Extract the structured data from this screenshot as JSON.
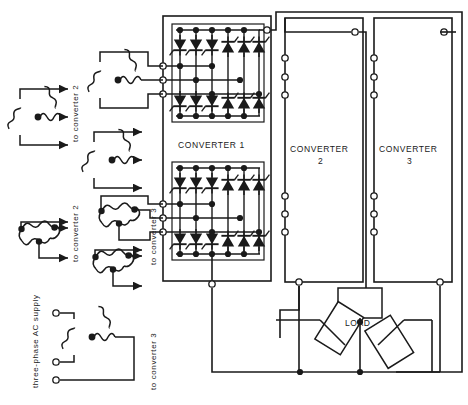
{
  "diagram": {
    "background_color": "#ffffff",
    "line_color": "#1a1a1a",
    "labels": {
      "converter_1": "CONVERTER 1",
      "converter_2_line1": "CONVERTER",
      "converter_2_line2": "2",
      "converter_3_line1": "CONVERTER",
      "converter_3_line2": "3",
      "load": "LOAD",
      "supply": "three-phase AC supply",
      "to_converter_2_upper": "to converter 2",
      "to_converter_3_upper": "to converter 3",
      "to_converter_2_lower": "to converter 2",
      "to_converter_3_lower": "to converter 3"
    },
    "blocks": [
      {
        "name": "converter-1",
        "label": "CONVERTER 1",
        "type": "thyristor-bridge-pair",
        "bridges": 2,
        "thyristors_per_bridge": 12
      },
      {
        "name": "converter-2",
        "label": "CONVERTER 2",
        "type": "block",
        "terminals_left": 6,
        "terminals_top": 1,
        "terminals_bottom": 1
      },
      {
        "name": "converter-3",
        "label": "CONVERTER 3",
        "type": "block",
        "terminals_left": 6,
        "terminals_top": 1,
        "terminals_bottom": 1
      }
    ],
    "transformers": [
      {
        "name": "transformer-star-left-upper",
        "connection": "star",
        "feeds": "to converter 2"
      },
      {
        "name": "transformer-star-mid-upper",
        "connection": "star",
        "feeds": "converter 1 upper bridge"
      },
      {
        "name": "transformer-star-left-lower-of-upper",
        "connection": "star",
        "feeds": "to converter 3"
      },
      {
        "name": "transformer-delta-left-lower",
        "connection": "delta",
        "feeds": "to converter 2"
      },
      {
        "name": "transformer-delta-mid-lower",
        "connection": "delta",
        "feeds": "converter 1 lower bridge"
      },
      {
        "name": "transformer-delta-left-bottom",
        "connection": "delta",
        "feeds": "to converter 3"
      },
      {
        "name": "transformer-supply-star",
        "connection": "star",
        "feeds": "three-phase AC supply"
      }
    ],
    "load": {
      "label": "LOAD",
      "phases": 3,
      "connection": "star"
    }
  }
}
